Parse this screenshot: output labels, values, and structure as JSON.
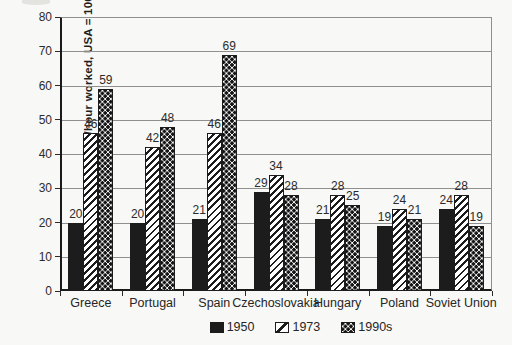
{
  "chart_data": {
    "type": "bar",
    "title": "",
    "ylabel": "GDP/hour worked, USA = 100",
    "xlabel": "",
    "ylim": [
      0,
      80
    ],
    "yticks": [
      0,
      10,
      20,
      30,
      40,
      50,
      60,
      70,
      80
    ],
    "grid": true,
    "value_labels": true,
    "legend_position": "bottom",
    "categories": [
      "Greece",
      "Portugal",
      "Spain",
      "Czechoslovakia",
      "Hungary",
      "Poland",
      "Soviet Union"
    ],
    "series": [
      {
        "name": "1950",
        "pattern": "solid-black",
        "values": [
          20,
          20,
          21,
          29,
          21,
          19,
          24
        ]
      },
      {
        "name": "1973",
        "pattern": "diagonal-hatch",
        "values": [
          46,
          42,
          46,
          34,
          28,
          24,
          28
        ]
      },
      {
        "name": "1990s",
        "pattern": "checker-dots",
        "values": [
          59,
          48,
          69,
          28,
          25,
          21,
          19
        ]
      }
    ]
  },
  "colors": {
    "bar_fill": "#1c1c1c",
    "grid_line": "#8f8f8f",
    "axis_line": "#1a1a1a",
    "background": "#f8f8f6",
    "text": "#262626"
  }
}
